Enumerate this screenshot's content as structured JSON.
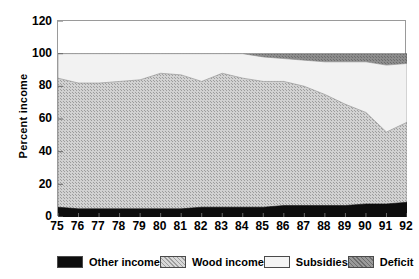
{
  "chart_data": {
    "type": "area",
    "stacked": true,
    "title": "",
    "xlabel": "",
    "ylabel": "Percent income",
    "x": [
      "75",
      "76",
      "77",
      "78",
      "79",
      "80",
      "81",
      "82",
      "83",
      "84",
      "85",
      "86",
      "87",
      "88",
      "89",
      "90",
      "91",
      "92"
    ],
    "xtick_labels": [
      "75",
      "76",
      "77",
      "78",
      "79",
      "80",
      "81",
      "82",
      "83",
      "84",
      "85",
      "86",
      "87",
      "88",
      "89",
      "90",
      "91",
      "92"
    ],
    "ytick_labels": [
      "0",
      "20",
      "40",
      "60",
      "80",
      "100",
      "120"
    ],
    "yticks": [
      0,
      20,
      40,
      60,
      80,
      100,
      120
    ],
    "ylim": [
      0,
      120
    ],
    "grid": false,
    "legend_position": "bottom",
    "series": [
      {
        "name": "Other income",
        "color": "#0d0d0d",
        "values": [
          6,
          5,
          5,
          5,
          5,
          5,
          5,
          6,
          6,
          6,
          6,
          7,
          7,
          7,
          7,
          8,
          8,
          9
        ]
      },
      {
        "name": "Wood income",
        "color": "#c3c3c3",
        "values": [
          79,
          77,
          77,
          78,
          79,
          83,
          82,
          77,
          82,
          79,
          77,
          76,
          73,
          68,
          62,
          56,
          44,
          49
        ]
      },
      {
        "name": "Subsidies",
        "color": "#efefef",
        "values": [
          15,
          18,
          18,
          17,
          16,
          12,
          13,
          17,
          12,
          15,
          15,
          14,
          16,
          20,
          26,
          31,
          41,
          36
        ]
      },
      {
        "name": "Deficit",
        "color": "#858585",
        "values": [
          0,
          0,
          0,
          0,
          0,
          0,
          0,
          0,
          0,
          0,
          2,
          3,
          4,
          5,
          5,
          5,
          7,
          6
        ]
      }
    ],
    "cumulative_tops": {
      "other_income": [
        6,
        5,
        5,
        5,
        5,
        5,
        5,
        6,
        6,
        6,
        6,
        7,
        7,
        7,
        7,
        8,
        8,
        9
      ],
      "wood_income": [
        85,
        82,
        82,
        83,
        84,
        88,
        87,
        83,
        88,
        85,
        83,
        83,
        80,
        75,
        69,
        64,
        52,
        58
      ],
      "subsidies": [
        100,
        100,
        100,
        100,
        100,
        100,
        100,
        100,
        100,
        100,
        98,
        97,
        96,
        95,
        95,
        95,
        93,
        94
      ],
      "deficit": [
        100,
        100,
        100,
        100,
        100,
        100,
        100,
        100,
        100,
        100,
        100,
        100,
        100,
        100,
        100,
        100,
        100,
        100
      ]
    }
  },
  "legend": {
    "items": [
      {
        "label": "Other income",
        "fill": "#0d0d0d"
      },
      {
        "label": "Wood income",
        "fill": "#c3c3c3"
      },
      {
        "label": "Subsidies",
        "fill": "#efefef"
      },
      {
        "label": "Deficit",
        "fill": "#858585"
      }
    ]
  }
}
